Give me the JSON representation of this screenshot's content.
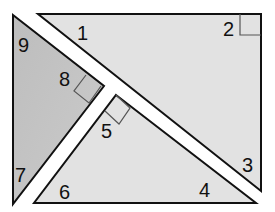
{
  "diagram": {
    "colors": {
      "background": "#ffffff",
      "light_fill": "#e2e2e2",
      "dark_fill": "#c4c4c4",
      "stroke": "#111111",
      "marker_stroke": "#555555"
    },
    "shapes": [
      {
        "name": "top-right-triangle",
        "fill": "light",
        "points": "38,14 261,14 261,191",
        "right_angle_marker": "240,14 240,35 261,35",
        "angles": [
          "1",
          "2",
          "3"
        ]
      },
      {
        "name": "left-triangle",
        "fill": "dark",
        "points": "13,15 104,86 13,204",
        "right_angle_marker": "101,86 89,103 74,91 86,75",
        "angles": [
          "7",
          "8",
          "9"
        ]
      },
      {
        "name": "bottom-triangle",
        "fill": "light",
        "points": "116,95 256,203 34,203",
        "right_angle_marker": "116,95 130,108 119,124 105,111",
        "angles": [
          "4",
          "5",
          "6"
        ]
      }
    ],
    "labels": [
      {
        "text": "1",
        "x": 77,
        "y": 40
      },
      {
        "text": "2",
        "x": 223,
        "y": 36
      },
      {
        "text": "3",
        "x": 242,
        "y": 172
      },
      {
        "text": "4",
        "x": 199,
        "y": 197
      },
      {
        "text": "5",
        "x": 101,
        "y": 138
      },
      {
        "text": "6",
        "x": 59,
        "y": 199
      },
      {
        "text": "7",
        "x": 15,
        "y": 182
      },
      {
        "text": "8",
        "x": 59,
        "y": 86
      },
      {
        "text": "9",
        "x": 18,
        "y": 52
      }
    ]
  }
}
